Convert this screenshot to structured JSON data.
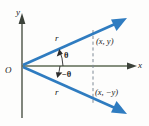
{
  "figure": {
    "kind": "polar-coordinate-diagram",
    "background_color": "#fdfdfc",
    "axis_color": "#4b5247",
    "ray_color": "#2f7cc0",
    "dash_color": "#7f8a96",
    "text_color": "#1a1a1a"
  },
  "axes": {
    "y_label": "y",
    "x_label": "x",
    "origin_label": "O"
  },
  "rays": [
    {
      "id": "ray-theta",
      "radius_label": "r",
      "angle_label": "θ",
      "endpoint_label": "(x, y)"
    },
    {
      "id": "ray-negative-theta",
      "radius_label": "r",
      "angle_label": "−θ",
      "endpoint_label": "(x, −y)"
    }
  ]
}
